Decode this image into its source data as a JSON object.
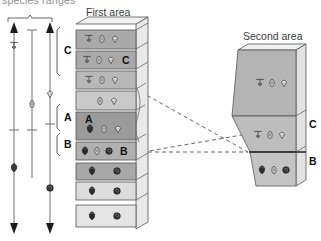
{
  "figure": {
    "clipped_title": "species ranges",
    "background": "#ffffff",
    "ink": "#3a3a3a"
  },
  "range_chart": {
    "name": "fossil-species-range-chart",
    "brackets": [
      {
        "label": "C",
        "y_top": 27,
        "y_bottom": 76,
        "label_x": 62,
        "label_y": 48
      },
      {
        "label": "A",
        "y_top": 104,
        "y_bottom": 131,
        "label_x": 62,
        "label_y": 113
      },
      {
        "label": "B",
        "y_top": 133,
        "y_bottom": 156,
        "label_x": 62,
        "label_y": 142
      }
    ],
    "top_brace": {
      "x1": 8,
      "x2": 52,
      "y": 18
    },
    "ranges": [
      {
        "name": "range-line-1",
        "x": 14,
        "top": 24,
        "bottom": 232,
        "arrow_top": true,
        "arrow_bottom": true,
        "symbols": [
          {
            "kind": "outline-bivalve",
            "y": 46
          },
          {
            "kind": "solid-ammonite",
            "y": 168
          }
        ]
      },
      {
        "name": "range-line-2",
        "x": 32,
        "top": 30,
        "bottom": 178,
        "arrow_top": false,
        "arrow_bottom": false,
        "symbols": [
          {
            "kind": "outline-ammonite",
            "y": 104
          }
        ]
      },
      {
        "name": "range-line-3",
        "x": 50,
        "top": 24,
        "bottom": 232,
        "arrow_top": true,
        "arrow_bottom": true,
        "symbols": [
          {
            "kind": "outline-gastropod",
            "y": 94
          },
          {
            "kind": "solid-gastropod",
            "y": 188
          }
        ]
      }
    ]
  },
  "first_area": {
    "name": "first-area-column",
    "title": "First area",
    "title_x": 86,
    "title_y": 7,
    "layers": [
      {
        "id": "L1",
        "top": 30,
        "height": 19,
        "fill": "#a9a9a9",
        "fossils": [
          "outline-bivalve",
          "outline-ammonite",
          "outline-gastropod"
        ],
        "tag": ""
      },
      {
        "id": "L2",
        "top": 51,
        "height": 18,
        "fill": "#a9a9a9",
        "fossils": [
          "outline-bivalve",
          "outline-ammonite",
          "outline-gastropod"
        ],
        "tag": "C"
      },
      {
        "id": "L3",
        "top": 71,
        "height": 18,
        "fill": "#b8b8b8",
        "fossils": [
          "outline-bivalve",
          "outline-ammonite",
          "outline-gastropod"
        ],
        "tag": ""
      },
      {
        "id": "L4",
        "top": 91,
        "height": 19,
        "fill": "#c9c9c9",
        "fossils": [
          "outline-ammonite",
          "outline-gastropod"
        ],
        "tag": ""
      },
      {
        "id": "L5",
        "top": 112,
        "height": 28,
        "fill": "#9a9a9a",
        "fossils": [
          "solid-bivalve",
          "outline-ammonite",
          "outline-gastropod"
        ],
        "tag": "A"
      },
      {
        "id": "L6",
        "top": 142,
        "height": 18,
        "fill": "#b0b0b0",
        "fossils": [
          "solid-bivalve",
          "outline-ammonite",
          "solid-gastropod"
        ],
        "tag": "B"
      },
      {
        "id": "L7",
        "top": 163,
        "height": 17,
        "fill": "#a9a9a9",
        "fossils": [
          "solid-bivalve",
          "solid-gastropod"
        ],
        "tag": ""
      },
      {
        "id": "L8",
        "top": 182,
        "height": 18,
        "fill": "#dcdcdc",
        "fossils": [
          "solid-bivalve",
          "solid-gastropod"
        ],
        "tag": ""
      },
      {
        "id": "L9",
        "top": 205,
        "height": 22,
        "fill": "#e4e4e4",
        "fossils": [
          "solid-bivalve",
          "solid-gastropod"
        ],
        "tag": ""
      }
    ]
  },
  "second_area": {
    "name": "second-area-block",
    "title": "Second area",
    "title_x": 243,
    "title_y": 31,
    "layers": [
      {
        "id": "S1",
        "fill": "#b4b4b4",
        "fossils": [
          "outline-bivalve",
          "outline-ammonite",
          "outline-gastropod"
        ],
        "tag": ""
      },
      {
        "id": "S2",
        "fill": "#bdbdbd",
        "fossils": [
          "outline-bivalve",
          "outline-ammonite",
          "outline-gastropod"
        ],
        "tag": "C"
      },
      {
        "id": "S3",
        "fill": "#c4c4c4",
        "fossils": [
          "solid-bivalve",
          "outline-ammonite",
          "solid-gastropod"
        ],
        "tag": "B"
      }
    ],
    "tag_c": {
      "label": "C",
      "x": 309,
      "y": 124
    },
    "tag_b": {
      "label": "B",
      "x": 309,
      "y": 160
    }
  },
  "correlation_lines": {
    "name": "correlation-dashed-lines",
    "color": "#555555",
    "lines": [
      {
        "x1": 141,
        "y1": 92,
        "x2": 248,
        "y2": 152
      },
      {
        "x1": 141,
        "y1": 152,
        "x2": 248,
        "y2": 152
      },
      {
        "x1": 141,
        "y1": 152,
        "x2": 241,
        "y2": 136
      }
    ]
  },
  "legend_symbols": {
    "outline-bivalve": "T-shaped outline shell",
    "outline-ammonite": "outline coiled ammonite",
    "outline-gastropod": "outline snail shell",
    "solid-bivalve": "filled dark shell",
    "solid-gastropod": "filled dark snail"
  }
}
